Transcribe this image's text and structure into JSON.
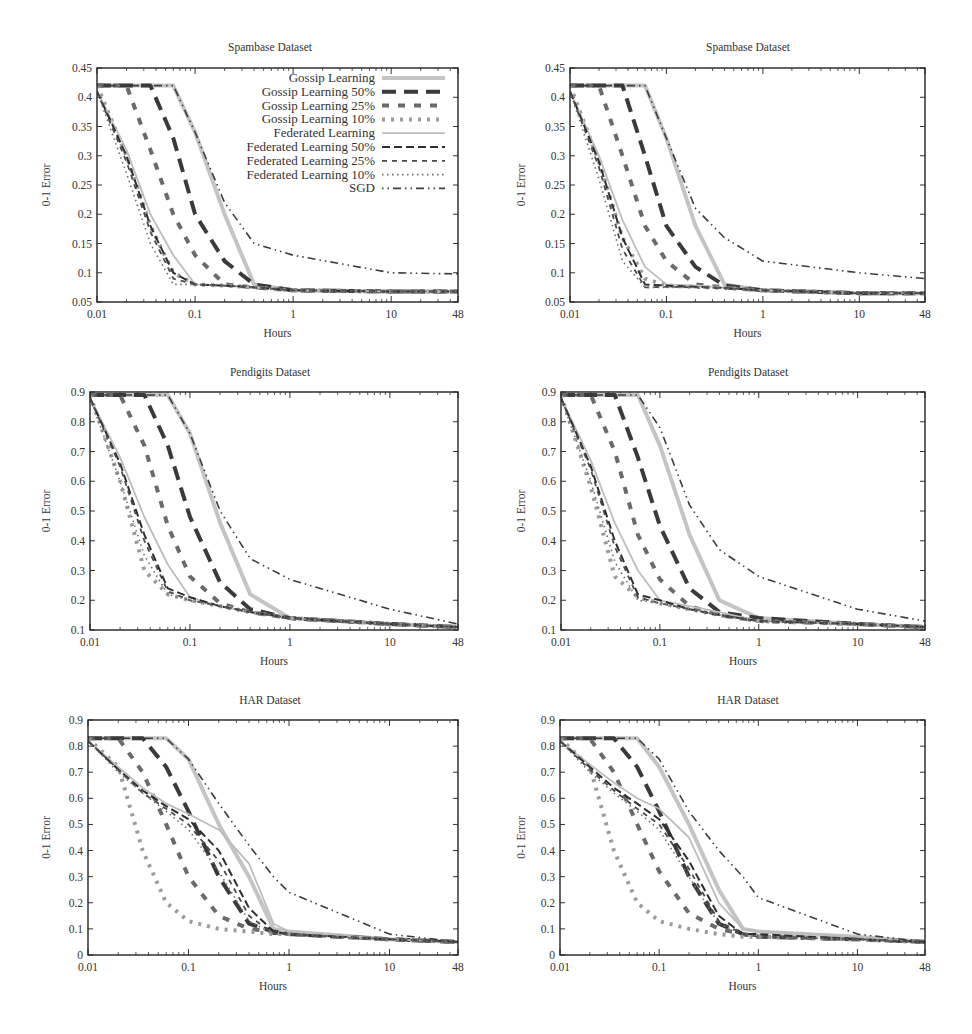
{
  "figure": {
    "x_axis_label": "Hours",
    "y_axis_label": "0-1 Error",
    "x_ticks": [
      "0.01",
      "0.1",
      "1",
      "10",
      "48"
    ],
    "legend": [
      {
        "label": "Gossip Learning",
        "style": "thick-solid-light"
      },
      {
        "label": "Gossip Learning 50%",
        "style": "thick-long-dash-dark"
      },
      {
        "label": "Gossip Learning 25%",
        "style": "thick-dash-medium"
      },
      {
        "label": "Gossip Learning 10%",
        "style": "thick-dot-light"
      },
      {
        "label": "Federated Learning",
        "style": "thin-solid-light"
      },
      {
        "label": "Federated Learning 50%",
        "style": "thin-dash-dark"
      },
      {
        "label": "Federated Learning 25%",
        "style": "thin-short-dash"
      },
      {
        "label": "Federated Learning 10%",
        "style": "thin-dot"
      },
      {
        "label": "SGD",
        "style": "dash-dot-dot-dark"
      }
    ]
  },
  "chart_data": [
    {
      "type": "line",
      "title": "Spambase Dataset",
      "xlabel": "Hours",
      "ylabel": "0-1 Error",
      "xscale": "log",
      "xlim": [
        0.01,
        48
      ],
      "ylim": [
        0.05,
        0.45
      ],
      "y_ticks": [
        "0.05",
        "0.1",
        "0.15",
        "0.2",
        "0.25",
        "0.3",
        "0.35",
        "0.4",
        "0.45"
      ],
      "legend_position": "upper right",
      "x": [
        0.01,
        0.02,
        0.035,
        0.06,
        0.1,
        0.2,
        0.4,
        1,
        10,
        48
      ],
      "series": [
        {
          "name": "Gossip Learning",
          "values": [
            0.42,
            0.42,
            0.42,
            0.42,
            0.34,
            0.2,
            0.08,
            0.07,
            0.068,
            0.068
          ]
        },
        {
          "name": "Gossip Learning 50%",
          "values": [
            0.42,
            0.42,
            0.42,
            0.33,
            0.2,
            0.12,
            0.08,
            0.07,
            0.068,
            0.068
          ]
        },
        {
          "name": "Gossip Learning 25%",
          "values": [
            0.42,
            0.42,
            0.31,
            0.2,
            0.13,
            0.08,
            0.075,
            0.07,
            0.068,
            0.068
          ]
        },
        {
          "name": "Gossip Learning 10%",
          "values": [
            0.42,
            0.3,
            0.18,
            0.1,
            0.08,
            0.078,
            0.075,
            0.07,
            0.068,
            0.068
          ]
        },
        {
          "name": "Federated Learning",
          "values": [
            0.41,
            0.31,
            0.2,
            0.13,
            0.08,
            0.078,
            0.075,
            0.07,
            0.068,
            0.068
          ]
        },
        {
          "name": "Federated Learning 50%",
          "values": [
            0.41,
            0.3,
            0.18,
            0.1,
            0.08,
            0.078,
            0.075,
            0.07,
            0.068,
            0.068
          ]
        },
        {
          "name": "Federated Learning 25%",
          "values": [
            0.41,
            0.29,
            0.17,
            0.09,
            0.08,
            0.078,
            0.075,
            0.07,
            0.068,
            0.068
          ]
        },
        {
          "name": "Federated Learning 10%",
          "values": [
            0.41,
            0.27,
            0.15,
            0.08,
            0.08,
            0.078,
            0.075,
            0.07,
            0.068,
            0.068
          ]
        },
        {
          "name": "SGD",
          "values": [
            0.42,
            0.42,
            0.42,
            0.42,
            0.34,
            0.22,
            0.15,
            0.13,
            0.1,
            0.098
          ]
        }
      ]
    },
    {
      "type": "line",
      "title": "Spambase Dataset",
      "xlabel": "Hours",
      "ylabel": "0-1 Error",
      "xscale": "log",
      "xlim": [
        0.01,
        48
      ],
      "ylim": [
        0.05,
        0.45
      ],
      "y_ticks": [
        "0.05",
        "0.1",
        "0.15",
        "0.2",
        "0.25",
        "0.3",
        "0.35",
        "0.4",
        "0.45"
      ],
      "x": [
        0.01,
        0.02,
        0.035,
        0.06,
        0.1,
        0.2,
        0.4,
        1,
        10,
        48
      ],
      "series": [
        {
          "name": "Gossip Learning",
          "values": [
            0.42,
            0.42,
            0.42,
            0.42,
            0.33,
            0.18,
            0.08,
            0.07,
            0.065,
            0.065
          ]
        },
        {
          "name": "Gossip Learning 50%",
          "values": [
            0.42,
            0.42,
            0.42,
            0.3,
            0.18,
            0.11,
            0.078,
            0.07,
            0.065,
            0.065
          ]
        },
        {
          "name": "Gossip Learning 25%",
          "values": [
            0.42,
            0.42,
            0.3,
            0.18,
            0.12,
            0.08,
            0.075,
            0.07,
            0.065,
            0.065
          ]
        },
        {
          "name": "Gossip Learning 10%",
          "values": [
            0.42,
            0.29,
            0.16,
            0.09,
            0.078,
            0.076,
            0.074,
            0.07,
            0.065,
            0.065
          ]
        },
        {
          "name": "Federated Learning",
          "values": [
            0.41,
            0.3,
            0.19,
            0.11,
            0.08,
            0.078,
            0.075,
            0.07,
            0.065,
            0.065
          ]
        },
        {
          "name": "Federated Learning 50%",
          "values": [
            0.41,
            0.29,
            0.16,
            0.08,
            0.078,
            0.076,
            0.074,
            0.07,
            0.065,
            0.065
          ]
        },
        {
          "name": "Federated Learning 25%",
          "values": [
            0.41,
            0.28,
            0.14,
            0.075,
            0.076,
            0.075,
            0.074,
            0.07,
            0.065,
            0.065
          ]
        },
        {
          "name": "Federated Learning 10%",
          "values": [
            0.41,
            0.26,
            0.12,
            0.075,
            0.075,
            0.075,
            0.074,
            0.07,
            0.065,
            0.065
          ]
        },
        {
          "name": "SGD",
          "values": [
            0.42,
            0.42,
            0.42,
            0.42,
            0.33,
            0.21,
            0.16,
            0.12,
            0.1,
            0.09
          ]
        }
      ]
    },
    {
      "type": "line",
      "title": "Pendigits Dataset",
      "xlabel": "Hours",
      "ylabel": "0-1 Error",
      "xscale": "log",
      "xlim": [
        0.01,
        48
      ],
      "ylim": [
        0.1,
        0.9
      ],
      "y_ticks": [
        "0.1",
        "0.2",
        "0.3",
        "0.4",
        "0.5",
        "0.6",
        "0.7",
        "0.8",
        "0.9"
      ],
      "x": [
        0.01,
        0.02,
        0.035,
        0.06,
        0.1,
        0.2,
        0.4,
        1,
        10,
        48
      ],
      "series": [
        {
          "name": "Gossip Learning",
          "values": [
            0.89,
            0.89,
            0.89,
            0.89,
            0.76,
            0.46,
            0.22,
            0.14,
            0.12,
            0.11
          ]
        },
        {
          "name": "Gossip Learning 50%",
          "values": [
            0.89,
            0.89,
            0.89,
            0.72,
            0.48,
            0.26,
            0.17,
            0.14,
            0.12,
            0.11
          ]
        },
        {
          "name": "Gossip Learning 25%",
          "values": [
            0.89,
            0.89,
            0.72,
            0.45,
            0.28,
            0.19,
            0.16,
            0.14,
            0.12,
            0.11
          ]
        },
        {
          "name": "Gossip Learning 10%",
          "values": [
            0.89,
            0.6,
            0.3,
            0.22,
            0.2,
            0.18,
            0.16,
            0.14,
            0.12,
            0.11
          ]
        },
        {
          "name": "Federated Learning",
          "values": [
            0.88,
            0.68,
            0.48,
            0.32,
            0.21,
            0.18,
            0.16,
            0.14,
            0.12,
            0.11
          ]
        },
        {
          "name": "Federated Learning 50%",
          "values": [
            0.88,
            0.66,
            0.42,
            0.24,
            0.21,
            0.18,
            0.16,
            0.14,
            0.12,
            0.11
          ]
        },
        {
          "name": "Federated Learning 25%",
          "values": [
            0.88,
            0.65,
            0.4,
            0.23,
            0.2,
            0.18,
            0.16,
            0.14,
            0.12,
            0.11
          ]
        },
        {
          "name": "Federated Learning 10%",
          "values": [
            0.88,
            0.6,
            0.35,
            0.22,
            0.2,
            0.18,
            0.16,
            0.14,
            0.12,
            0.11
          ]
        },
        {
          "name": "SGD",
          "values": [
            0.89,
            0.89,
            0.89,
            0.89,
            0.76,
            0.5,
            0.34,
            0.27,
            0.17,
            0.12
          ]
        }
      ]
    },
    {
      "type": "line",
      "title": "Pendigits Dataset",
      "xlabel": "Hours",
      "ylabel": "0-1 Error",
      "xscale": "log",
      "xlim": [
        0.01,
        48
      ],
      "ylim": [
        0.1,
        0.9
      ],
      "y_ticks": [
        "0.1",
        "0.2",
        "0.3",
        "0.4",
        "0.5",
        "0.6",
        "0.7",
        "0.8",
        "0.9"
      ],
      "x": [
        0.01,
        0.02,
        0.035,
        0.06,
        0.1,
        0.2,
        0.4,
        1,
        10,
        48
      ],
      "series": [
        {
          "name": "Gossip Learning",
          "values": [
            0.89,
            0.89,
            0.89,
            0.89,
            0.72,
            0.42,
            0.2,
            0.14,
            0.12,
            0.11
          ]
        },
        {
          "name": "Gossip Learning 50%",
          "values": [
            0.89,
            0.89,
            0.89,
            0.68,
            0.45,
            0.24,
            0.16,
            0.14,
            0.12,
            0.11
          ]
        },
        {
          "name": "Gossip Learning 25%",
          "values": [
            0.89,
            0.89,
            0.7,
            0.42,
            0.27,
            0.18,
            0.15,
            0.13,
            0.12,
            0.11
          ]
        },
        {
          "name": "Gossip Learning 10%",
          "values": [
            0.89,
            0.58,
            0.28,
            0.21,
            0.19,
            0.17,
            0.15,
            0.13,
            0.12,
            0.11
          ]
        },
        {
          "name": "Federated Learning",
          "values": [
            0.88,
            0.67,
            0.46,
            0.3,
            0.2,
            0.18,
            0.16,
            0.13,
            0.12,
            0.11
          ]
        },
        {
          "name": "Federated Learning 50%",
          "values": [
            0.88,
            0.65,
            0.4,
            0.22,
            0.2,
            0.17,
            0.15,
            0.13,
            0.12,
            0.11
          ]
        },
        {
          "name": "Federated Learning 25%",
          "values": [
            0.88,
            0.64,
            0.38,
            0.21,
            0.19,
            0.17,
            0.15,
            0.13,
            0.12,
            0.11
          ]
        },
        {
          "name": "Federated Learning 10%",
          "values": [
            0.88,
            0.6,
            0.33,
            0.2,
            0.19,
            0.17,
            0.15,
            0.13,
            0.12,
            0.11
          ]
        },
        {
          "name": "SGD",
          "values": [
            0.89,
            0.89,
            0.89,
            0.89,
            0.78,
            0.52,
            0.37,
            0.28,
            0.17,
            0.13
          ]
        }
      ]
    },
    {
      "type": "line",
      "title": "HAR Dataset",
      "xlabel": "Hours",
      "ylabel": "0-1 Error",
      "xscale": "log",
      "xlim": [
        0.01,
        48
      ],
      "ylim": [
        0,
        0.9
      ],
      "y_ticks": [
        "0",
        "0.1",
        "0.2",
        "0.3",
        "0.4",
        "0.5",
        "0.6",
        "0.7",
        "0.8",
        "0.9"
      ],
      "x": [
        0.01,
        0.02,
        0.035,
        0.06,
        0.1,
        0.2,
        0.4,
        0.7,
        1,
        10,
        48
      ],
      "series": [
        {
          "name": "Gossip Learning",
          "values": [
            0.83,
            0.83,
            0.83,
            0.83,
            0.75,
            0.5,
            0.3,
            0.1,
            0.09,
            0.06,
            0.05
          ]
        },
        {
          "name": "Gossip Learning 50%",
          "values": [
            0.83,
            0.83,
            0.83,
            0.72,
            0.55,
            0.3,
            0.12,
            0.09,
            0.08,
            0.06,
            0.05
          ]
        },
        {
          "name": "Gossip Learning 25%",
          "values": [
            0.83,
            0.83,
            0.7,
            0.5,
            0.3,
            0.15,
            0.1,
            0.09,
            0.08,
            0.06,
            0.05
          ]
        },
        {
          "name": "Gossip Learning 10%",
          "values": [
            0.83,
            0.72,
            0.4,
            0.2,
            0.13,
            0.1,
            0.09,
            0.08,
            0.08,
            0.06,
            0.05
          ]
        },
        {
          "name": "Federated Learning",
          "values": [
            0.82,
            0.72,
            0.64,
            0.58,
            0.54,
            0.48,
            0.35,
            0.12,
            0.09,
            0.06,
            0.05
          ]
        },
        {
          "name": "Federated Learning 50%",
          "values": [
            0.82,
            0.71,
            0.63,
            0.57,
            0.52,
            0.4,
            0.18,
            0.09,
            0.08,
            0.06,
            0.05
          ]
        },
        {
          "name": "Federated Learning 25%",
          "values": [
            0.82,
            0.71,
            0.62,
            0.56,
            0.5,
            0.36,
            0.15,
            0.08,
            0.08,
            0.06,
            0.05
          ]
        },
        {
          "name": "Federated Learning 10%",
          "values": [
            0.82,
            0.7,
            0.62,
            0.55,
            0.48,
            0.32,
            0.13,
            0.08,
            0.08,
            0.06,
            0.05
          ]
        },
        {
          "name": "SGD",
          "values": [
            0.83,
            0.83,
            0.83,
            0.83,
            0.75,
            0.58,
            0.42,
            0.3,
            0.24,
            0.08,
            0.05
          ]
        }
      ]
    },
    {
      "type": "line",
      "title": "HAR Dataset",
      "xlabel": "Hours",
      "ylabel": "0-1 Error",
      "xscale": "log",
      "xlim": [
        0.01,
        48
      ],
      "ylim": [
        0,
        0.9
      ],
      "y_ticks": [
        "0",
        "0.1",
        "0.2",
        "0.3",
        "0.4",
        "0.5",
        "0.6",
        "0.7",
        "0.8",
        "0.9"
      ],
      "x": [
        0.01,
        0.02,
        0.035,
        0.06,
        0.1,
        0.2,
        0.4,
        0.7,
        1,
        10,
        48
      ],
      "series": [
        {
          "name": "Gossip Learning",
          "values": [
            0.83,
            0.83,
            0.83,
            0.83,
            0.72,
            0.5,
            0.25,
            0.1,
            0.09,
            0.07,
            0.05
          ]
        },
        {
          "name": "Gossip Learning 50%",
          "values": [
            0.83,
            0.83,
            0.83,
            0.72,
            0.55,
            0.3,
            0.12,
            0.08,
            0.07,
            0.06,
            0.05
          ]
        },
        {
          "name": "Gossip Learning 25%",
          "values": [
            0.83,
            0.83,
            0.7,
            0.5,
            0.32,
            0.16,
            0.1,
            0.08,
            0.07,
            0.06,
            0.05
          ]
        },
        {
          "name": "Gossip Learning 10%",
          "values": [
            0.83,
            0.72,
            0.4,
            0.2,
            0.13,
            0.1,
            0.08,
            0.07,
            0.07,
            0.06,
            0.05
          ]
        },
        {
          "name": "Federated Learning",
          "values": [
            0.82,
            0.73,
            0.66,
            0.6,
            0.56,
            0.45,
            0.2,
            0.1,
            0.09,
            0.07,
            0.05
          ]
        },
        {
          "name": "Federated Learning 50%",
          "values": [
            0.82,
            0.72,
            0.64,
            0.58,
            0.52,
            0.36,
            0.15,
            0.08,
            0.08,
            0.06,
            0.05
          ]
        },
        {
          "name": "Federated Learning 25%",
          "values": [
            0.82,
            0.71,
            0.63,
            0.56,
            0.5,
            0.33,
            0.13,
            0.08,
            0.07,
            0.06,
            0.05
          ]
        },
        {
          "name": "Federated Learning 10%",
          "values": [
            0.82,
            0.7,
            0.62,
            0.55,
            0.48,
            0.3,
            0.12,
            0.08,
            0.07,
            0.06,
            0.05
          ]
        },
        {
          "name": "SGD",
          "values": [
            0.83,
            0.83,
            0.83,
            0.83,
            0.75,
            0.55,
            0.4,
            0.3,
            0.22,
            0.08,
            0.05
          ]
        }
      ]
    }
  ]
}
